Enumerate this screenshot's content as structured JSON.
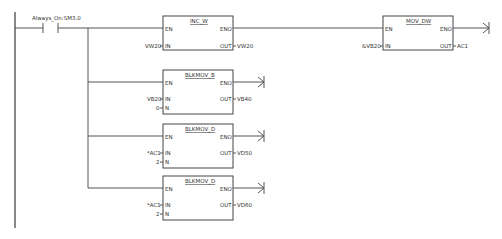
{
  "diagram": {
    "type": "ladder-logic",
    "contact": {
      "label": "Always_On:SM3.0"
    },
    "blocks": [
      {
        "title": "INC_W",
        "pins_left": [
          "EN",
          "IN"
        ],
        "pins_right": [
          "ENO",
          "OUT"
        ],
        "inputs": {
          "IN": "VW20"
        },
        "outputs": {
          "OUT": "VW20"
        }
      },
      {
        "title": "MOV_DW",
        "pins_left": [
          "EN",
          "IN"
        ],
        "pins_right": [
          "ENO",
          "OUT"
        ],
        "inputs": {
          "IN": "&VB20"
        },
        "outputs": {
          "OUT": "AC1"
        }
      },
      {
        "title": "BLKMOV_B",
        "pins_left": [
          "EN",
          "IN",
          "N"
        ],
        "pins_right": [
          "ENO",
          "OUT"
        ],
        "inputs": {
          "IN": "VB20",
          "N": "0"
        },
        "outputs": {
          "OUT": "VB40"
        }
      },
      {
        "title": "BLKMOV_D",
        "pins_left": [
          "EN",
          "IN",
          "N"
        ],
        "pins_right": [
          "ENO",
          "OUT"
        ],
        "inputs": {
          "IN": "*AC1",
          "N": "2"
        },
        "outputs": {
          "OUT": "VD50"
        }
      },
      {
        "title": "BLKMOV_D",
        "pins_left": [
          "EN",
          "IN",
          "N"
        ],
        "pins_right": [
          "ENO",
          "OUT"
        ],
        "inputs": {
          "IN": "*AC1",
          "N": "2"
        },
        "outputs": {
          "OUT": "VD60"
        }
      }
    ]
  }
}
